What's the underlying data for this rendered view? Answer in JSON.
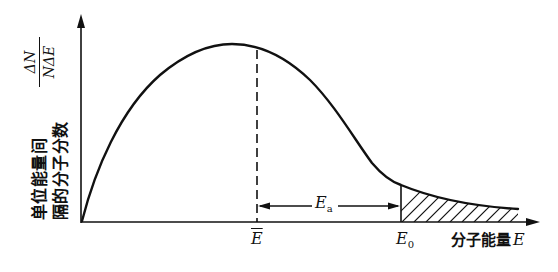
{
  "diagram": {
    "type": "Maxwell-Boltzmann molecular energy distribution",
    "y_axis": {
      "label_line1": "单位能量间",
      "label_line2": "隔的分子分数",
      "fraction_numerator": "ΔN",
      "fraction_denominator": "NΔE"
    },
    "x_axis": {
      "label_text": "分子能量",
      "label_symbol": "E"
    },
    "markers": {
      "mean_energy": "E",
      "threshold_energy": "E",
      "threshold_sub": "0",
      "activation_energy": "E",
      "activation_sub": "a"
    },
    "colors": {
      "stroke": "#111111",
      "background": "#ffffff"
    }
  }
}
